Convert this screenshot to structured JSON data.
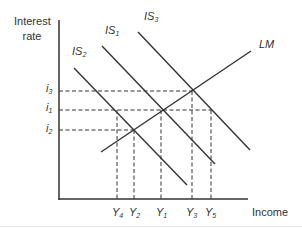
{
  "diagram": {
    "y_axis_label_line1": "Interest",
    "y_axis_label_line2": "rate",
    "x_axis_label": "Income",
    "curves": {
      "is1": {
        "base": "IS",
        "sub": "1"
      },
      "is2": {
        "base": "IS",
        "sub": "2"
      },
      "is3": {
        "base": "IS",
        "sub": "3"
      },
      "lm": {
        "label": "LM"
      }
    },
    "interest_levels": {
      "i3": {
        "base": "i",
        "sub": "3"
      },
      "i1": {
        "base": "i",
        "sub": "1"
      },
      "i2": {
        "base": "i",
        "sub": "2"
      }
    },
    "income_levels": {
      "y4": {
        "base": "Y",
        "sub": "4"
      },
      "y2": {
        "base": "Y",
        "sub": "2"
      },
      "y1": {
        "base": "Y",
        "sub": "1"
      },
      "y3": {
        "base": "Y",
        "sub": "3"
      },
      "y5": {
        "base": "Y",
        "sub": "5"
      }
    },
    "colors": {
      "line": "#333333",
      "text": "#333333",
      "background": "#ffffff"
    }
  }
}
